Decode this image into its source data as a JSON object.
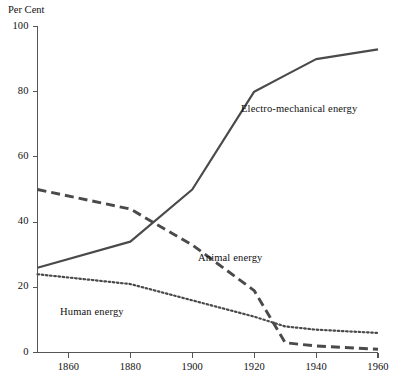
{
  "chart_data": {
    "type": "line",
    "title": "",
    "xlabel": "",
    "ylabel": "Per Cent",
    "xlim": [
      1850,
      1960
    ],
    "ylim": [
      0,
      100
    ],
    "grid": false,
    "legend_position": "inline-annotations",
    "x_ticks": [
      "1860",
      "1880",
      "1900",
      "1920",
      "1940",
      "1960"
    ],
    "x_tick_values": [
      1860,
      1880,
      1900,
      1920,
      1940,
      1960
    ],
    "y_ticks": [
      "0",
      "20",
      "40",
      "60",
      "80",
      "100"
    ],
    "y_tick_values": [
      0,
      20,
      40,
      60,
      80,
      100
    ],
    "series": [
      {
        "name": "Electro-mechanical energy",
        "style": "solid",
        "color": "#4a4a4a",
        "x": [
          1850,
          1880,
          1900,
          1920,
          1930,
          1940,
          1960
        ],
        "values": [
          26,
          34,
          50,
          80,
          85,
          90,
          93
        ]
      },
      {
        "name": "Animal energy",
        "style": "dashed",
        "color": "#4a4a4a",
        "x": [
          1850,
          1880,
          1900,
          1920,
          1930,
          1940,
          1960
        ],
        "values": [
          50,
          44,
          33,
          19,
          3,
          2,
          1
        ]
      },
      {
        "name": "Human energy",
        "style": "dotted",
        "color": "#4a4a4a",
        "x": [
          1850,
          1880,
          1900,
          1920,
          1930,
          1940,
          1960
        ],
        "values": [
          24,
          21,
          16,
          11,
          8,
          7,
          6
        ]
      }
    ],
    "annotations": [
      {
        "text": "Electro-mechanical energy",
        "x_px": 241,
        "y_px": 103
      },
      {
        "text": "Animal energy",
        "x_px": 198,
        "y_px": 252
      },
      {
        "text": "Human energy",
        "x_px": 60,
        "y_px": 306
      }
    ]
  },
  "axis": {
    "y_axis_title": "Per Cent"
  }
}
